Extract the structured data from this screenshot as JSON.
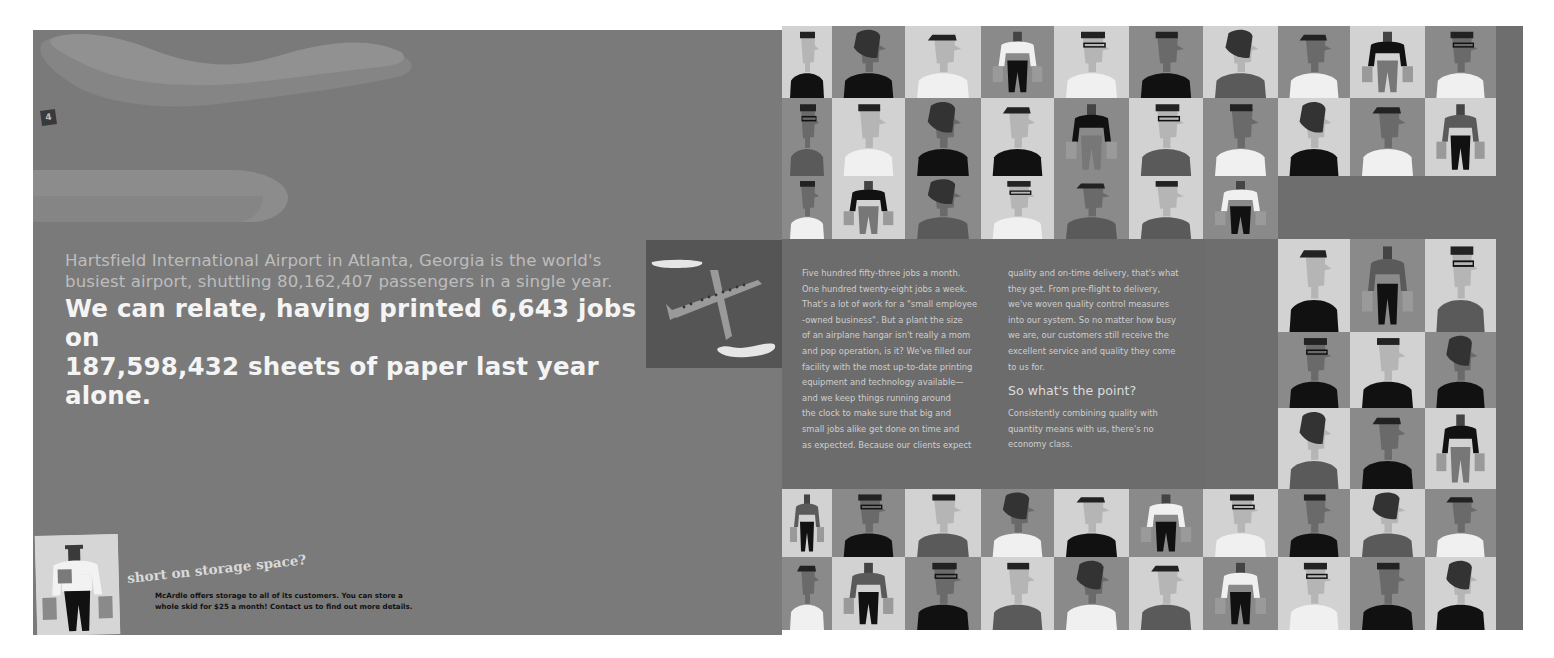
{
  "left_page": {
    "page_number": "4",
    "headline": {
      "line_1": "Hartsfield International Airport in Atlanta, Georgia is the world's",
      "line_2": "busiest airport, shuttling 80,162,407 passengers in a single year.",
      "main_line_1": "We can relate, having printed 6,643 jobs on",
      "main_line_2": "187,598,432 sheets of paper last year alone."
    },
    "storage_callout": {
      "title": "short on storage space?",
      "body_line_1": "McArdle offers storage to all of its customers. You can store a",
      "body_line_2": "whole skid for $25 a month! Contact us to find out more details."
    },
    "icons": [
      "airplane-icon",
      "cloud-icon",
      "porter-with-bags-icon"
    ]
  },
  "right_page": {
    "column_1": [
      "Five hundred fifty-three jobs a month.",
      "One hundred twenty-eight jobs a week.",
      "That's a lot of work for a \"small employee",
      "-owned business\". But a plant the size",
      "of an airplane hangar isn't really a mom",
      "and pop operation, is it? We've filled our",
      "facility with the most up-to-date printing",
      "equipment and technology available—",
      "and we keep things running around",
      "the clock to make sure that big and",
      "small jobs alike get done on time and",
      "as expected. Because our clients expect"
    ],
    "column_2": [
      "quality and on-time delivery, that's what",
      "they get. From pre-flight to delivery,",
      "we've woven quality control measures",
      "into our system. So no matter how busy",
      "we are, our customers still receive the",
      "excellent service and quality they come",
      "to us for."
    ],
    "point_heading": "So what's the point?",
    "point_body": [
      "Consistently combining quality with",
      "quantity means with us, there's no",
      "economy class."
    ]
  },
  "colors": {
    "left_background": "#7a7a7a",
    "right_background": "#6e6e6e",
    "tile_light": "#d2d2d2",
    "tile_mid": "#8a8a8a",
    "headline_main": "#f4f4f4",
    "headline_sub": "#bdbdbd"
  }
}
